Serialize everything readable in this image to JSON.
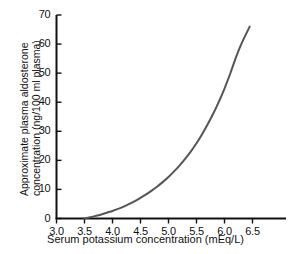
{
  "chart_data": {
    "type": "line",
    "title": "",
    "xlabel": "Serum potassium concentration (mEq/L)",
    "ylabel_line1": "Approximate plasma aldosterone",
    "ylabel_line2": "concentration (ng/100 ml plasma)",
    "xlim": [
      3.0,
      6.75
    ],
    "ylim": [
      0,
      70
    ],
    "xticks": [
      "3.0",
      "3.5",
      "4.0",
      "4.5",
      "5.0",
      "5.5",
      "6.0",
      "6.5"
    ],
    "xtick_values": [
      3.0,
      3.5,
      4.0,
      4.5,
      5.0,
      5.5,
      6.0,
      6.5
    ],
    "yticks": [
      "0",
      "10",
      "20",
      "30",
      "40",
      "50",
      "60",
      "70"
    ],
    "ytick_values": [
      0,
      10,
      20,
      30,
      40,
      50,
      60,
      70
    ],
    "grid": false,
    "legend": false,
    "series": [
      {
        "name": "Plasma aldosterone concentration",
        "color": "#555555",
        "x": [
          3.5,
          3.6,
          3.7,
          3.8,
          3.9,
          4.0,
          4.1,
          4.2,
          4.3,
          4.4,
          4.5,
          4.6,
          4.7,
          4.8,
          4.9,
          5.0,
          5.1,
          5.2,
          5.3,
          5.4,
          5.5,
          5.6,
          5.7,
          5.8,
          5.9,
          6.0,
          6.1,
          6.2,
          6.3,
          6.45
        ],
        "values": [
          0.0,
          0.4,
          0.9,
          1.4,
          2.0,
          2.6,
          3.3,
          4.1,
          5.0,
          6.0,
          7.1,
          8.3,
          9.6,
          11.0,
          12.6,
          14.3,
          16.2,
          18.3,
          20.6,
          23.1,
          25.9,
          29.0,
          32.4,
          36.1,
          40.2,
          44.7,
          49.7,
          55.2,
          60.0,
          66.0
        ]
      }
    ]
  },
  "axes": {
    "axis_color": "#111111",
    "curve_color": "#555555"
  }
}
